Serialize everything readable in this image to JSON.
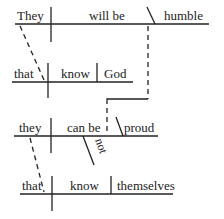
{
  "diagram": {
    "type": "sentence-diagram (Reed-Kellogg)",
    "clauses": [
      {
        "id": "main1",
        "subject": "They",
        "verb": "will be",
        "complement": "humble"
      },
      {
        "id": "rel1",
        "connector": "that",
        "verb": "know",
        "object": "God"
      },
      {
        "id": "main2",
        "subject": "they",
        "verb": "can be",
        "modifier": "not",
        "complement": "proud"
      },
      {
        "id": "rel2",
        "connector": "that",
        "verb": "know",
        "object": "themselves"
      }
    ],
    "connections": [
      {
        "from": "main1.subject",
        "to": "rel1.connector",
        "style": "dashed"
      },
      {
        "from": "main1.complement",
        "to": "main2.verb",
        "style": "dashed"
      },
      {
        "from": "main2.subject",
        "to": "rel2.connector",
        "style": "dashed"
      }
    ]
  }
}
